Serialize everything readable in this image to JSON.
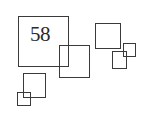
{
  "label": {
    "text": "58"
  },
  "colors": {
    "stroke": "#3a3a3a",
    "text": "#2a2a2a",
    "background": "#ffffff"
  },
  "squares": [
    {
      "name": "large-square",
      "x": 18,
      "y": 16,
      "w": 51,
      "h": 51
    },
    {
      "name": "overlap-square",
      "x": 59,
      "y": 45,
      "w": 31,
      "h": 33
    },
    {
      "name": "top-right-square",
      "x": 95,
      "y": 23,
      "w": 26,
      "h": 26
    },
    {
      "name": "small-right-square",
      "x": 112,
      "y": 51,
      "w": 15,
      "h": 18
    },
    {
      "name": "tiny-right-square",
      "x": 123,
      "y": 43,
      "w": 13,
      "h": 14
    },
    {
      "name": "lower-left-square",
      "x": 23,
      "y": 73,
      "w": 23,
      "h": 25
    },
    {
      "name": "tiny-left-square",
      "x": 17,
      "y": 92,
      "w": 14,
      "h": 14
    }
  ]
}
